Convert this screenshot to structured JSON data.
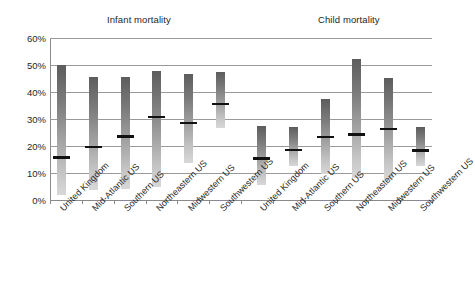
{
  "chart_data": {
    "type": "bar",
    "chart_style": "floating-range-bar-with-median",
    "title": "",
    "xlabel": "",
    "ylabel": "",
    "ylim": [
      0,
      60
    ],
    "y_tick_labels": [
      "60%",
      "50%",
      "40%",
      "30%",
      "20%",
      "10%",
      "0%"
    ],
    "y_ticks": [
      60,
      50,
      40,
      30,
      20,
      10,
      0
    ],
    "grid": true,
    "legend": "none",
    "group_titles": [
      "Infant mortality",
      "Child mortality"
    ],
    "categories": [
      "United Kingdom",
      "Mid-Atlantic US",
      "Southern US",
      "Northeastern US",
      "Midwestern US",
      "Southwestern US",
      "United Kingdom",
      "Mid-Atlantic US",
      "Southern US",
      "Northeastern US",
      "Midwestern US",
      "Southwestern US"
    ],
    "series": [
      {
        "name": "range_low",
        "values": [
          2.0,
          3.8,
          4.0,
          4.8,
          13.7,
          26.6,
          5.6,
          12.7,
          9.7,
          8.0,
          7.3,
          12.5
        ]
      },
      {
        "name": "range_high",
        "values": [
          49.9,
          45.7,
          45.7,
          47.6,
          46.6,
          47.4,
          27.4,
          27.2,
          37.4,
          52.4,
          45.3,
          27.0
        ]
      },
      {
        "name": "median",
        "values": [
          15.7,
          19.7,
          23.6,
          30.7,
          28.6,
          35.6,
          15.3,
          18.6,
          23.3,
          24.3,
          26.3,
          18.4
        ]
      }
    ],
    "groups": [
      {
        "label": "Infant mortality",
        "bar_indices": [
          0,
          1,
          2,
          3,
          4,
          5
        ]
      },
      {
        "label": "Child mortality",
        "bar_indices": [
          6,
          7,
          8,
          9,
          10,
          11
        ]
      }
    ],
    "colors": {
      "bar_top": "#5d5d5d",
      "bar_bottom": "#d8d8d8",
      "median_marker": "#111111",
      "gridline": "#9a9a9a",
      "axis": "#8a8a8a",
      "text": "#1f1f1f",
      "background": "#ffffff"
    }
  }
}
